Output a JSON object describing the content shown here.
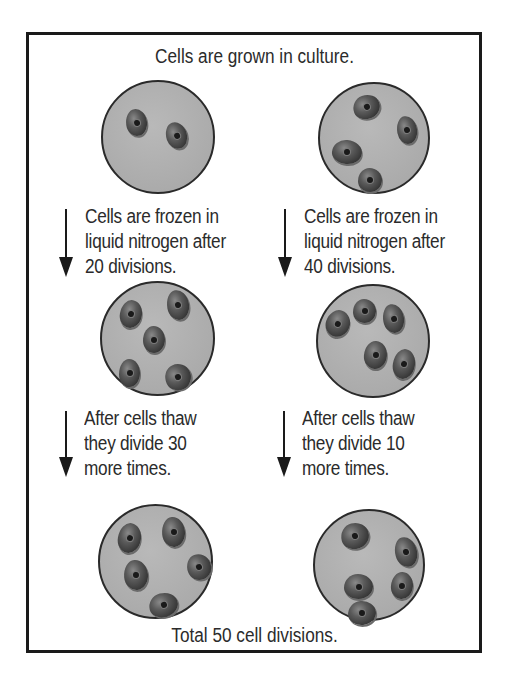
{
  "diagram": {
    "title": "Cells are grown in culture.",
    "footer": "Total 50 cell divisions.",
    "colors": {
      "border": "#1a1a1a",
      "dish_fill": "#b0b0b0",
      "cell_fill": "#3a3a3a",
      "text": "#2b2b2b"
    },
    "left_column": {
      "step1": {
        "line1": "Cells are frozen in",
        "line2": "liquid nitrogen after",
        "line3": "20 divisions."
      },
      "step2": {
        "line1": "After cells thaw",
        "line2": "they divide 30",
        "line3": "more times."
      },
      "dish_cell_counts": [
        2,
        5,
        5
      ]
    },
    "right_column": {
      "step1": {
        "line1": "Cells are frozen in",
        "line2": "liquid nitrogen after",
        "line3": "40 divisions."
      },
      "step2": {
        "line1": "After cells thaw",
        "line2": "they divide 10",
        "line3": "more times."
      },
      "dish_cell_counts": [
        4,
        5,
        5
      ]
    },
    "icons": {
      "arrow": "down-arrow-icon",
      "dish": "petri-dish-icon",
      "cell": "cell-icon"
    }
  }
}
